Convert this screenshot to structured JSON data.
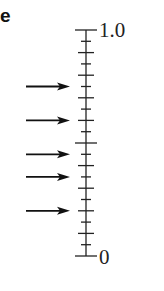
{
  "panel": {
    "label": "e"
  },
  "scale": {
    "top_label": "1.0",
    "bottom_label": "0",
    "min": 0,
    "max": 1.0,
    "minor_step": 0.05,
    "major_step": 0.1,
    "mid_value": 0.5
  },
  "arrows": [
    0.75,
    0.6,
    0.45,
    0.35,
    0.2
  ],
  "chart_data": {
    "type": "scatter",
    "title": "",
    "xlabel": "",
    "ylabel": "",
    "ylim": [
      0,
      1.0
    ],
    "tick_labels": [
      "0",
      "1.0"
    ],
    "values": [
      0.75,
      0.6,
      0.45,
      0.35,
      0.2
    ],
    "annotations": [
      "arrows pointing to scale values"
    ],
    "grid": false
  }
}
